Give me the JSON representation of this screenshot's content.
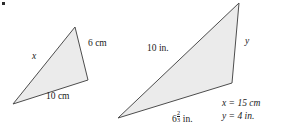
{
  "figure": {
    "corner_mark": "bullet-mark",
    "stroke_color": "#4d4d4d",
    "fill_color": "#ebebeb",
    "text_color": "#1a1a1a"
  },
  "small_triangle": {
    "name": "small-triangle-cm",
    "points": "13,104 75,27 88,80",
    "labels": {
      "side_x": "x",
      "side_6cm": "6 cm",
      "side_10cm": "10 cm"
    }
  },
  "large_triangle": {
    "name": "large-triangle-in",
    "points": "118,118 239,3 232,83",
    "labels": {
      "side_10in": "10 in.",
      "side_y": "y",
      "side_bottom_whole": "6",
      "side_bottom_numerator": "2",
      "side_bottom_denominator": "3",
      "side_bottom_unit": "in."
    }
  },
  "legend": {
    "name": "answer-legend",
    "line_x": "x = 15 cm",
    "line_y": "y = 4 in."
  }
}
